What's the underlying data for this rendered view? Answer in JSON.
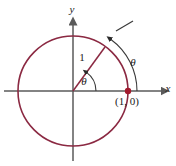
{
  "figure": {
    "width": 176,
    "height": 166,
    "background_color": "#ffffff"
  },
  "colors": {
    "circle_stroke": "#8B2942",
    "radius_stroke": "#8B2942",
    "point_fill": "#A31A2E",
    "axis_stroke": "#5a5a5a",
    "annotation_stroke": "#3a3a3a",
    "text": "#1a1a1a"
  },
  "axes": {
    "x_label": "x",
    "y_label": "y",
    "origin": {
      "x": 73,
      "y": 91
    },
    "x_axis": {
      "x1": 4,
      "y1": 91,
      "x2": 162,
      "y2": 91
    },
    "y_axis": {
      "x1": 73,
      "y1": 161,
      "x2": 73,
      "y2": 24
    }
  },
  "circle": {
    "center_x": 73,
    "center_y": 91,
    "radius": 55,
    "stroke_width": 1.6
  },
  "radius_segment": {
    "label": "1",
    "label_x": 82,
    "label_y": 61,
    "from_x": 73,
    "from_y": 91,
    "to_x": 105,
    "to_y": 47
  },
  "central_angle": {
    "label": "θ",
    "label_x": 84,
    "label_y": 85,
    "arc_radius": 23,
    "start_deg": 0,
    "end_deg": 54
  },
  "arc_length_annotation": {
    "label": "θ",
    "label_x": 133,
    "label_y": 66,
    "arc_radius": 64,
    "start_deg": 0,
    "end_deg": 54,
    "tick_x1": 116,
    "tick_y1": 31,
    "tick_x2": 133,
    "tick_y2": 21
  },
  "marked_point": {
    "label": "(1, 0)",
    "label_x": 127,
    "label_y": 105,
    "cx": 128,
    "cy": 91,
    "r": 3.2
  }
}
